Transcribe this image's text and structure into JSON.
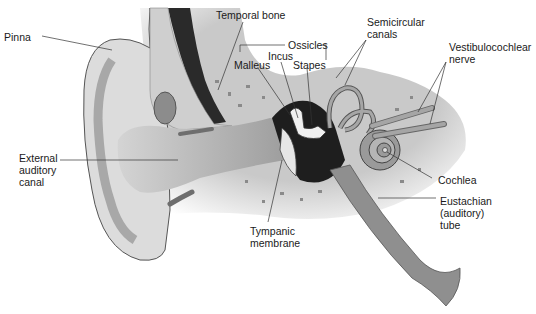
{
  "diagram": {
    "colors": {
      "background": "#ffffff",
      "skin_light": "#d9d9d9",
      "skin_mid": "#bdbdbd",
      "bone": "#c8c8c8",
      "bone_spots": "#8a8a8a",
      "canal": "#b0b0b0",
      "dark": "#1e1e1e",
      "tube": "#8f8f8f",
      "label_text": "#1a1a1a",
      "leader_line": "#333333"
    },
    "labels": {
      "pinna": "Pinna",
      "temporal_bone": "Temporal bone",
      "ossicles": "Ossicles",
      "malleus": "Malleus",
      "incus": "Incus",
      "stapes": "Stapes",
      "semicircular_canals": "Semicircular\ncanals",
      "vestibulocochlear_nerve": "Vestibulocochlear\nnerve",
      "external_auditory_canal": "External\nauditory\ncanal",
      "cochlea": "Cochlea",
      "eustachian_tube": "Eustachian\n(auditory)\ntube",
      "tympanic_membrane": "Tympanic\nmembrane"
    }
  }
}
